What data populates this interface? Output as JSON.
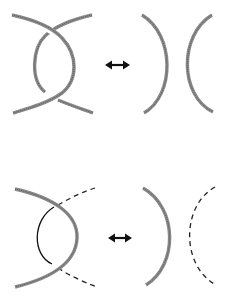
{
  "diagram": {
    "title": "",
    "rows": [
      {
        "name": "top-move",
        "left_figure": "two thick strands crossing twice (clasp/bigon)",
        "relation_symbol": "↔",
        "right_figure": "two thick arcs facing apart ) ("
      },
      {
        "name": "bottom-move",
        "left_figure": "thick arc crossing a thin solid arc with dashed continuations",
        "relation_symbol": "↔",
        "right_figure": "thick arc ) and dashed arc ("
      }
    ],
    "colors": {
      "background": "#ffffff",
      "thick_strand": "#8a8a8a",
      "thin_strand": "#111111",
      "arrow": "#111111"
    }
  }
}
